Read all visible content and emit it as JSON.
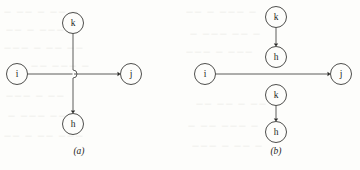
{
  "figure": {
    "background_color": "#fdfdfb",
    "ink_color": "#3a3a38",
    "panels": [
      {
        "id": "panel-a",
        "caption": "(a)",
        "caption_x": 79,
        "caption_y": 152,
        "description": "Single vertex i with edges crossing at a junction; k above, h below, j to the right",
        "nodes": [
          {
            "id": "k",
            "label": "k",
            "cx": 73,
            "cy": 23,
            "r": 10.5
          },
          {
            "id": "i",
            "label": "i",
            "cx": 17,
            "cy": 74,
            "r": 10.5
          },
          {
            "id": "j",
            "label": "j",
            "cx": 131,
            "cy": 74,
            "r": 10.5
          },
          {
            "id": "h",
            "label": "h",
            "cx": 73,
            "cy": 124,
            "r": 10.5
          }
        ],
        "edges": [
          {
            "from": "k",
            "to": "junction",
            "direction": "down",
            "arrow": false
          },
          {
            "from": "i",
            "to": "junction",
            "direction": "right",
            "arrow": false
          },
          {
            "from": "junction",
            "to": "j",
            "direction": "right",
            "arrow": true
          },
          {
            "from": "junction",
            "to": "h",
            "direction": "down",
            "arrow": true
          }
        ],
        "junction": {
          "x": 73,
          "y": 74,
          "hop": true,
          "hop_radius": 4
        }
      },
      {
        "id": "panel-b",
        "caption": "(b)",
        "caption_x": 276,
        "caption_y": 152,
        "description": "Vertex i connects to j by a straight edge passing between two k-to-h pairs",
        "nodes": [
          {
            "id": "k-top",
            "label": "k",
            "cx": 276,
            "cy": 17,
            "r": 10.5
          },
          {
            "id": "h-top",
            "label": "h",
            "cx": 276,
            "cy": 57,
            "r": 10.5
          },
          {
            "id": "i",
            "label": "i",
            "cx": 205,
            "cy": 74,
            "r": 10.5
          },
          {
            "id": "j",
            "label": "j",
            "cx": 341,
            "cy": 74,
            "r": 10.5
          },
          {
            "id": "k-bottom",
            "label": "k",
            "cx": 276,
            "cy": 95,
            "r": 10.5
          },
          {
            "id": "h-bottom",
            "label": "h",
            "cx": 276,
            "cy": 132,
            "r": 10.5
          }
        ],
        "edges": [
          {
            "from": "k-top",
            "to": "h-top",
            "direction": "down",
            "arrow": true
          },
          {
            "from": "i",
            "to": "j",
            "direction": "right",
            "arrow": true
          },
          {
            "from": "k-bottom",
            "to": "h-bottom",
            "direction": "down",
            "arrow": true
          }
        ]
      }
    ]
  },
  "ghost_marks": [
    {
      "x": 4,
      "y": 8,
      "text": "— —— — —— —"
    },
    {
      "x": 6,
      "y": 26,
      "text": "—— — ———"
    },
    {
      "x": 4,
      "y": 44,
      "text": "——— — —— ——"
    },
    {
      "x": 10,
      "y": 62,
      "text": "—— —— ——— —"
    },
    {
      "x": 6,
      "y": 92,
      "text": "——— — ——"
    },
    {
      "x": 8,
      "y": 112,
      "text": "— ——— ——"
    },
    {
      "x": 4,
      "y": 132,
      "text": "—— — —— ———"
    },
    {
      "x": 186,
      "y": 8,
      "text": "—— — ——— —"
    },
    {
      "x": 190,
      "y": 30,
      "text": "— ——— —— —"
    },
    {
      "x": 186,
      "y": 48,
      "text": "——— — ———"
    },
    {
      "x": 196,
      "y": 100,
      "text": "—— —— — ——"
    },
    {
      "x": 188,
      "y": 122,
      "text": "— —— ——— —"
    },
    {
      "x": 192,
      "y": 142,
      "text": "——— — —— —"
    }
  ]
}
